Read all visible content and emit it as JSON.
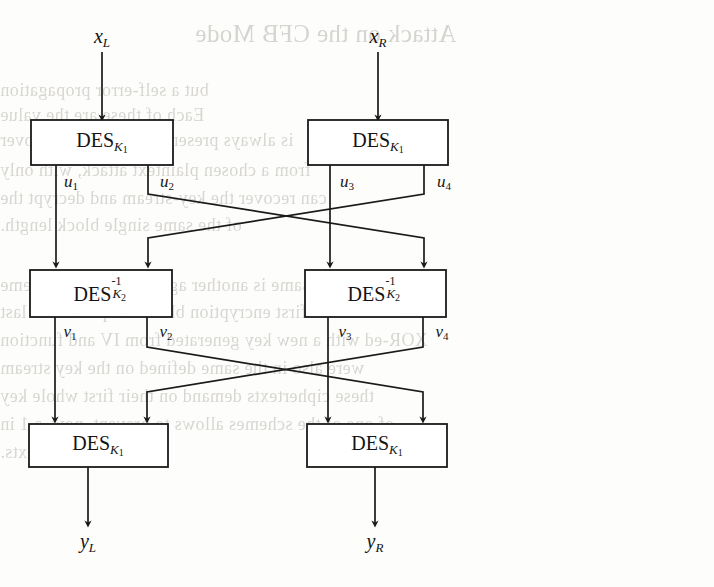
{
  "figure": {
    "type": "block-diagram",
    "background_color": "#fdfdfb",
    "line_color": "#1a1a1a",
    "text_color": "#121212"
  },
  "inputs": [
    {
      "id": "xL",
      "label_main": "x",
      "label_sub": "L",
      "x": 102,
      "label_y": 38,
      "arrow_top": 52,
      "arrow_bottom": 118
    },
    {
      "id": "xR",
      "label_main": "x",
      "label_sub": "R",
      "x": 378,
      "label_y": 38,
      "arrow_top": 52,
      "arrow_bottom": 118
    }
  ],
  "outputs": [
    {
      "id": "yL",
      "label_main": "y",
      "label_sub": "L",
      "x": 88,
      "label_y": 543,
      "arrow_top": 467,
      "arrow_bottom": 524
    },
    {
      "id": "yR",
      "label_main": "y",
      "label_sub": "R",
      "x": 375,
      "label_y": 543,
      "arrow_top": 467,
      "arrow_bottom": 524
    }
  ],
  "boxes": [
    {
      "id": "des-top-left",
      "text": "DES",
      "sub": "K",
      "subsub": "1",
      "inverse": false,
      "x": 31,
      "y": 120,
      "w": 142,
      "h": 45,
      "cx": 102,
      "cy": 142
    },
    {
      "id": "des-top-right",
      "text": "DES",
      "sub": "K",
      "subsub": "1",
      "inverse": false,
      "x": 308,
      "y": 120,
      "w": 140,
      "h": 45,
      "cx": 378,
      "cy": 142
    },
    {
      "id": "des-inv-mid-left",
      "text": "DES",
      "sub": "K",
      "subsub": "2",
      "sup": "-1",
      "inverse": true,
      "x": 30,
      "y": 270,
      "w": 142,
      "h": 47,
      "cx": 101,
      "cy": 293
    },
    {
      "id": "des-inv-mid-right",
      "text": "DES",
      "sub": "K",
      "subsub": "2",
      "sup": "-1",
      "inverse": true,
      "x": 305,
      "y": 270,
      "w": 141,
      "h": 47,
      "cx": 375,
      "cy": 293
    },
    {
      "id": "des-bottom-left",
      "text": "DES",
      "sub": "K",
      "subsub": "1",
      "inverse": false,
      "x": 29,
      "y": 424,
      "w": 139,
      "h": 43,
      "cx": 98,
      "cy": 445
    },
    {
      "id": "des-bottom-right",
      "text": "DES",
      "sub": "K",
      "subsub": "1",
      "inverse": false,
      "x": 307,
      "y": 424,
      "w": 140,
      "h": 43,
      "cx": 377,
      "cy": 445
    }
  ],
  "wire_labels": [
    {
      "id": "u1",
      "main": "u",
      "sub": "1",
      "x": 71,
      "y": 182
    },
    {
      "id": "u2",
      "main": "u",
      "sub": "2",
      "x": 167,
      "y": 182
    },
    {
      "id": "u3",
      "main": "u",
      "sub": "3",
      "x": 347,
      "y": 182
    },
    {
      "id": "u4",
      "main": "u",
      "sub": "4",
      "x": 444,
      "y": 182
    },
    {
      "id": "v1",
      "main": "v",
      "sub": "1",
      "x": 70,
      "y": 332
    },
    {
      "id": "v2",
      "main": "v",
      "sub": "2",
      "x": 166,
      "y": 332
    },
    {
      "id": "v3",
      "main": "v",
      "sub": "3",
      "x": 345,
      "y": 332
    },
    {
      "id": "v4",
      "main": "v",
      "sub": "4",
      "x": 442,
      "y": 332
    }
  ],
  "wires": {
    "straight_down": [
      {
        "id": "u1-wire",
        "x": 56,
        "from_y": 165,
        "to_y": 265
      },
      {
        "id": "u3-wire",
        "x": 330,
        "from_y": 165,
        "to_y": 265
      },
      {
        "id": "v1-wire",
        "x": 55,
        "from_y": 317,
        "to_y": 420
      },
      {
        "id": "v3-wire",
        "x": 328,
        "from_y": 317,
        "to_y": 420
      }
    ],
    "crossing_upper": [
      {
        "id": "u2-to-v4",
        "start_x": 148,
        "start_y": 165,
        "bend1_y": 194,
        "end_x": 424,
        "bend2_y": 238,
        "end_y": 265
      },
      {
        "id": "u4-to-v2",
        "start_x": 424,
        "start_y": 165,
        "bend1_y": 194,
        "end_x": 148,
        "bend2_y": 238,
        "end_y": 265
      }
    ],
    "crossing_lower": [
      {
        "id": "v2-to-bottom-right",
        "start_x": 147,
        "start_y": 317,
        "bend1_y": 347,
        "end_x": 423,
        "bend2_y": 392,
        "end_y": 420
      },
      {
        "id": "v4-to-bottom-left",
        "start_x": 423,
        "start_y": 317,
        "bend1_y": 347,
        "end_x": 147,
        "bend2_y": 392,
        "end_y": 420
      }
    ]
  },
  "ghost_text": {
    "note": "faint mirrored bleed-through from the reverse side of the scanned page",
    "lines": [
      {
        "text": "Attack on the CFB Mode",
        "x": 195,
        "y": 20,
        "size": 25,
        "cls": "ghost-title"
      },
      {
        "text": "but a self-error propagation",
        "x": 0,
        "y": 80,
        "size": 18,
        "cls": "ghost-body"
      },
      {
        "text": "Each of these are the value",
        "x": 0,
        "y": 105,
        "size": 18,
        "cls": "ghost-body"
      },
      {
        "text": "is always present as it is under recover",
        "x": 0,
        "y": 130,
        "size": 18,
        "cls": "ghost-body"
      },
      {
        "text": "from a chosen plaintext attack, with only",
        "x": 0,
        "y": 160,
        "size": 18,
        "cls": "ghost-body"
      },
      {
        "text": "can recover the key-stream and decrypt the",
        "x": 0,
        "y": 188,
        "size": 18,
        "cls": "ghost-body"
      },
      {
        "text": "of the same single block length.",
        "x": 0,
        "y": 215,
        "size": 18,
        "cls": "ghost-body"
      },
      {
        "text": "Here this same is another against the same scheme",
        "x": 0,
        "y": 275,
        "size": 18,
        "cls": "ghost-body"
      },
      {
        "text": "blocks. The first encryption block is equal to the last",
        "x": 0,
        "y": 302,
        "size": 18,
        "cls": "ghost-body"
      },
      {
        "text": "XOR-ed with a new key generated from IV and function",
        "x": 0,
        "y": 330,
        "size": 18,
        "cls": "ghost-body"
      },
      {
        "text": "were also in the same defined on the key stream",
        "x": 0,
        "y": 358,
        "size": 18,
        "cls": "ghost-body"
      },
      {
        "text": "these ciphertexts demand on their first whole key",
        "x": 0,
        "y": 386,
        "size": 18,
        "cls": "ghost-body"
      },
      {
        "text": "of one of the schemes allows to prevent, now, a 1 in",
        "x": 0,
        "y": 414,
        "size": 18,
        "cls": "ghost-body"
      },
      {
        "text": "chosen plaintexts.",
        "x": 0,
        "y": 442,
        "size": 18,
        "cls": "ghost-body"
      }
    ]
  }
}
